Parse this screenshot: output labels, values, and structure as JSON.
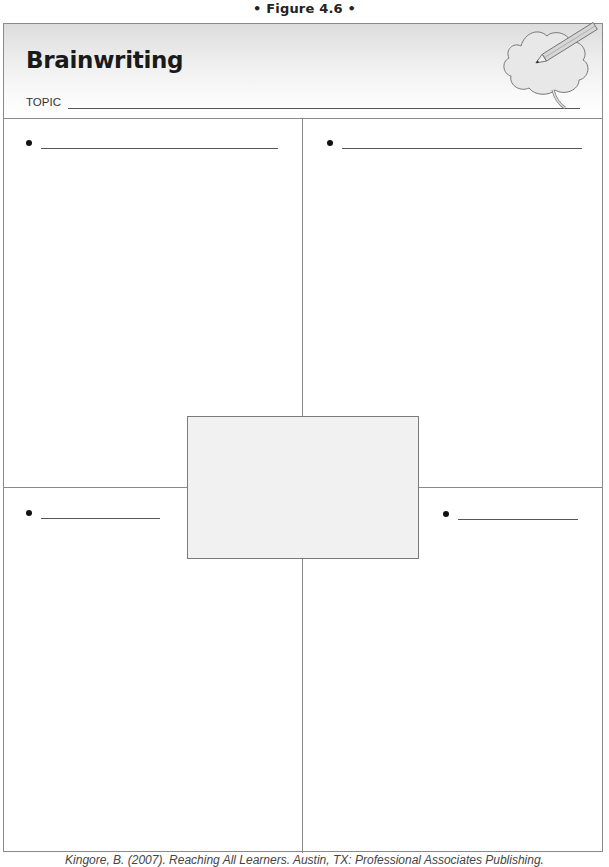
{
  "figure": {
    "caption": "• Figure 4.6 •"
  },
  "header": {
    "title": "Brainwriting",
    "topic_label": "TOPIC",
    "topic_value": "",
    "illustration_icon": "brain-with-pencil-icon"
  },
  "quadrants": [
    {
      "position": "top-left",
      "bullet": "•",
      "value": ""
    },
    {
      "position": "top-right",
      "bullet": "•",
      "value": ""
    },
    {
      "position": "bottom-left",
      "bullet": "•",
      "value": ""
    },
    {
      "position": "bottom-right",
      "bullet": "•",
      "value": ""
    }
  ],
  "center_box": {
    "value": "",
    "fill_color": "#f1f1f1"
  },
  "footer": {
    "citation": "Kingore, B. (2007). Reaching All Learners. Austin, TX: Professional Associates Publishing."
  }
}
